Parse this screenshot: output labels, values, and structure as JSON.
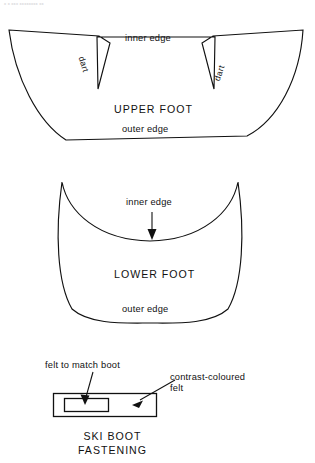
{
  "page": {
    "top_note": "x x xxx xxxxxxxx xx",
    "background_color": "#ffffff",
    "ink_color": "#111111"
  },
  "upper_foot": {
    "title": "UPPER FOOT",
    "inner_edge_label": "inner edge",
    "outer_edge_label": "outer edge",
    "dart_left_label": "dart",
    "dart_right_label": "dart"
  },
  "lower_foot": {
    "title": "LOWER FOOT",
    "inner_edge_label": "inner edge",
    "outer_edge_label": "outer edge"
  },
  "ski_boot_fastening": {
    "title_line1": "SKI BOOT",
    "title_line2": "FASTENING",
    "felt_match_label": "felt to match boot",
    "contrast_label_line1": "contrast-coloured",
    "contrast_label_line2": "felt"
  }
}
